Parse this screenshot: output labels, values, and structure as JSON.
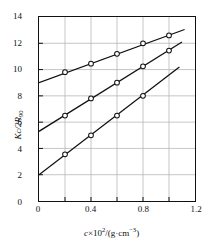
{
  "chart_data": {
    "type": "line",
    "title": "",
    "xlabel": "c×10²/(g·cm⁻³)",
    "ylabel": "Kc/2R₉₀",
    "xlim": [
      0,
      1.2
    ],
    "ylim": [
      0,
      14
    ],
    "xticks": [
      0,
      0.2,
      0.4,
      0.6,
      0.8,
      1.0,
      1.2
    ],
    "xticklabels": [
      "0",
      "",
      "0.4",
      "",
      "0.8",
      "",
      "1.2"
    ],
    "yticks": [
      0,
      2,
      4,
      6,
      8,
      10,
      12,
      14
    ],
    "yticklabels": [
      "0",
      "2",
      "4",
      "6",
      "8",
      "10",
      "12",
      "14"
    ],
    "grid": true,
    "legend": "none",
    "marker": "open-circle",
    "series": [
      {
        "name": "upper-line",
        "intercept": 9.0,
        "x": [
          0.2,
          0.4,
          0.6,
          0.8,
          1.0
        ],
        "values": [
          9.8,
          10.45,
          11.2,
          12.0,
          12.6
        ],
        "line_x": [
          0.0,
          1.12
        ],
        "line_y": [
          9.0,
          13.05
        ]
      },
      {
        "name": "middle-line",
        "intercept": 5.3,
        "x": [
          0.2,
          0.4,
          0.6,
          0.8,
          1.0
        ],
        "values": [
          6.5,
          7.8,
          9.0,
          10.25,
          11.45
        ],
        "line_x": [
          0.0,
          1.1
        ],
        "line_y": [
          5.3,
          12.1
        ]
      },
      {
        "name": "lower-line",
        "intercept": 2.0,
        "x": [
          0.2,
          0.4,
          0.6,
          0.8
        ],
        "values": [
          3.55,
          5.0,
          6.5,
          8.0
        ],
        "line_x": [
          0.0,
          1.08
        ],
        "line_y": [
          2.0,
          10.2
        ]
      }
    ]
  },
  "axis": {
    "y_title_main": "Kc/2R",
    "y_title_sub": "90",
    "x_title_var": "c",
    "x_title_times": "×10",
    "x_title_exp": "2",
    "x_title_unit": "/(g·cm",
    "x_title_unit_exp": "−3",
    "x_title_close": ")"
  },
  "colors": {
    "line": "#111111",
    "grid": "#b8b8b8",
    "frame": "#111111",
    "marker_face": "#ffffff",
    "background": "#ffffff"
  }
}
